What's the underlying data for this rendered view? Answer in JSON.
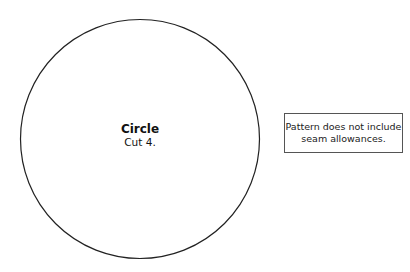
{
  "pattern_piece": {
    "shape": "circle",
    "title": "Circle",
    "instruction": "Cut 4.",
    "stroke_color": "#222222"
  },
  "note": {
    "line1": "Pattern does not include",
    "line2": "seam allowances."
  }
}
